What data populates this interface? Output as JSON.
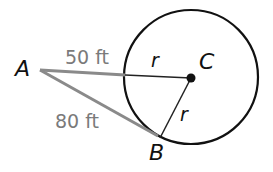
{
  "diagram": {
    "points": {
      "A": {
        "label": "A",
        "x": 40,
        "y": 70
      },
      "B": {
        "label": "B",
        "x": 160,
        "y": 138
      },
      "C": {
        "label": "C",
        "x": 191,
        "y": 77
      }
    },
    "circle": {
      "center": "C",
      "radius": 67
    },
    "segments": [
      {
        "id": "AE",
        "from": "A",
        "to": "circle-left",
        "label": "50 ft",
        "color": "#8a8a8a"
      },
      {
        "id": "AB",
        "from": "A",
        "to": "B",
        "label": "80 ft",
        "color": "#8a8a8a"
      },
      {
        "id": "EC",
        "from": "circle-left",
        "to": "C",
        "label": "r",
        "color": "#222222"
      },
      {
        "id": "CB",
        "from": "C",
        "to": "B",
        "label": "r",
        "color": "#222222"
      }
    ],
    "labels": {
      "point_a": "A",
      "point_b": "B",
      "point_c": "C",
      "segment_ae": "50 ft",
      "segment_ab": "80 ft",
      "radius_top": "r",
      "radius_bottom": "r"
    },
    "colors": {
      "circle": "#111111",
      "tangent_lines": "#8a8a8a",
      "radius_lines": "#222222",
      "measurement_text": "#7a7a7a"
    }
  }
}
